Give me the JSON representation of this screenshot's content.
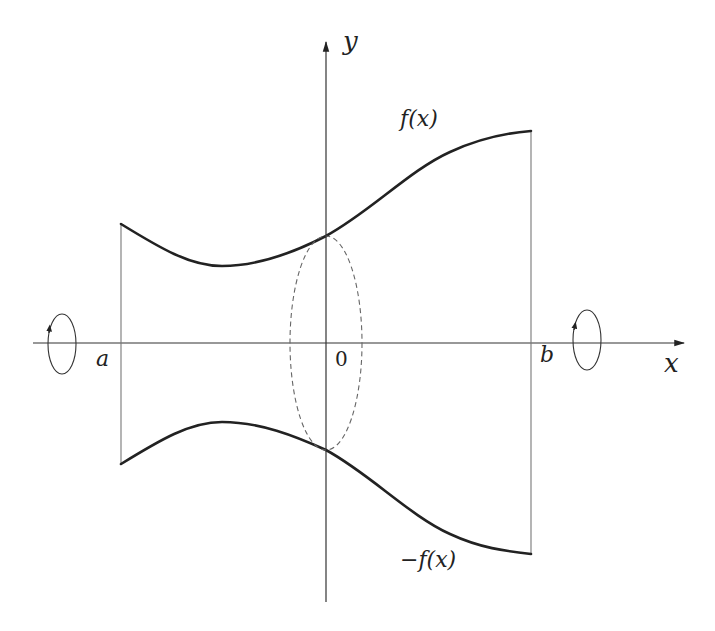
{
  "figure": {
    "type": "solid-of-revolution-diagram",
    "labels": {
      "y_axis": "y",
      "x_axis": "x",
      "origin": "0",
      "left_bound": "a",
      "right_bound": "b",
      "upper_curve": "f(x)",
      "lower_curve": "−f(x)"
    },
    "colors": {
      "curve": "#222222",
      "axis": "#333333",
      "boundary": "#666666",
      "dashed_ellipse": "#666666",
      "background": "#ffffff"
    }
  }
}
